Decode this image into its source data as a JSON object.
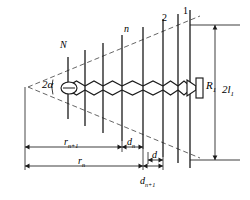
{
  "figure": {
    "type": "log-periodic-dipole-array-schematic",
    "stroke_color": "#1a1a1a",
    "dashed_color": "#555555",
    "background": "#ffffff"
  },
  "geometry": {
    "apex": {
      "x": 28,
      "y": 87
    },
    "half_angle_deg": 16.5,
    "upper_envelope": {
      "x1": 28,
      "y1": 87,
      "x2": 200,
      "y2": 16
    },
    "lower_envelope": {
      "x1": 28,
      "y1": 87,
      "x2": 200,
      "y2": 158
    },
    "boom_y": 88,
    "elements": [
      {
        "index": 1,
        "x": 68,
        "top": 57,
        "bottom": 119
      },
      {
        "index": 2,
        "x": 85,
        "top": 50,
        "bottom": 126
      },
      {
        "index": 3,
        "x": 103,
        "top": 43,
        "bottom": 133
      },
      {
        "index": 4,
        "x": 122,
        "top": 35,
        "bottom": 141
      },
      {
        "index": 5,
        "x": 143,
        "top": 27,
        "bottom": 149
      },
      {
        "index": 6,
        "x": 163,
        "top": 19,
        "bottom": 157
      },
      {
        "index": 7,
        "x": 178,
        "top": 14,
        "bottom": 163
      },
      {
        "index": 8,
        "x": 190,
        "top": 10,
        "bottom": 168
      }
    ]
  },
  "labels": {
    "angle": "2α",
    "element_N": "N",
    "element_n": "n",
    "element_2": "2",
    "element_1": "1",
    "load_resistor": "R",
    "load_resistor_sub": "1",
    "total_length": "2l",
    "total_length_sub": "1",
    "dim_r_n_plus_1": "r",
    "dim_r_n_plus_1_sub": "n+1",
    "dim_r_n": "r",
    "dim_r_n_sub": "n",
    "dim_d_n": "d",
    "dim_d_n_sub": "n",
    "dim_d": "d",
    "dim_d_n_plus_1": "d",
    "dim_d_n_plus_1_sub": "n+1"
  },
  "dimensions": {
    "r_n_plus_1": {
      "x1": 25,
      "x2": 122,
      "y": 147
    },
    "r_n": {
      "x1": 25,
      "x2": 143,
      "y": 166
    },
    "d_n": {
      "x1": 122,
      "x2": 143,
      "y": 147
    },
    "d": {
      "x1": 148,
      "x2": 163,
      "y": 160
    },
    "d_n_plus_1": {
      "x1": 143,
      "x2": 163,
      "y": 166
    },
    "two_l_1": {
      "x": 215,
      "y1": 25,
      "y2": 160
    }
  },
  "components": {
    "feed_source": {
      "cx": 69,
      "cy": 88,
      "rx": 8,
      "ry": 6,
      "name": "generator"
    },
    "load": {
      "x": 196,
      "y": 78,
      "w": 7,
      "h": 20,
      "name": "terminating-resistor"
    }
  }
}
